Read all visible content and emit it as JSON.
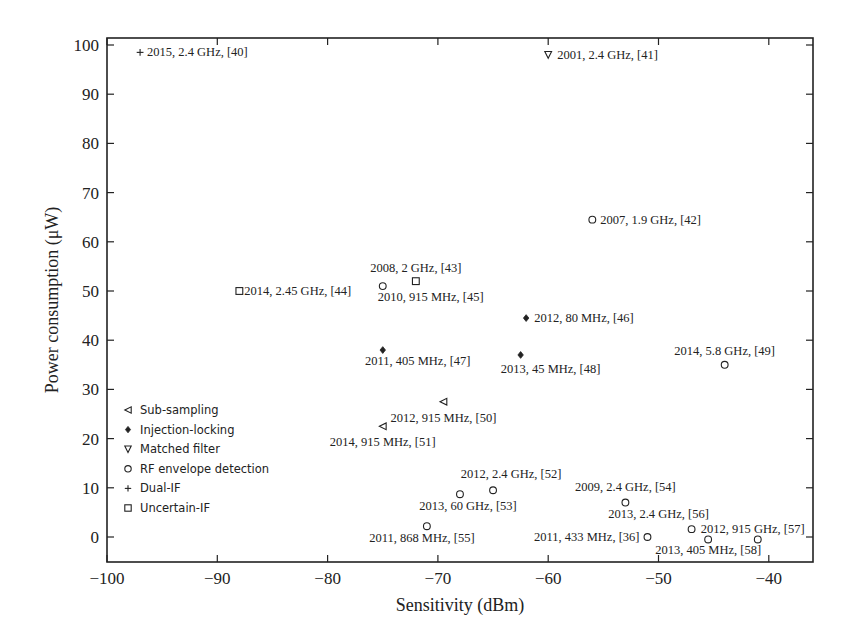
{
  "chart_data": {
    "type": "scatter",
    "title": "",
    "xlabel": "Sensitivity (dBm)",
    "ylabel": "Power consumption (μW)",
    "xlim": [
      -100,
      -36
    ],
    "ylim": [
      -5,
      102
    ],
    "xticks": [
      -100,
      -90,
      -80,
      -70,
      -60,
      -50,
      -40
    ],
    "xtick_labels": [
      "−100",
      "−90",
      "−80",
      "−70",
      "−60",
      "−50",
      "−40"
    ],
    "yticks": [
      0,
      10,
      20,
      30,
      40,
      50,
      60,
      70,
      80,
      90,
      100
    ],
    "grid": false,
    "legend_position": "lower left inside",
    "legend": [
      {
        "name": "Sub-sampling",
        "marker": "triangle-left"
      },
      {
        "name": "Injection-locking",
        "marker": "diamond-filled"
      },
      {
        "name": "Matched filter",
        "marker": "triangle-down"
      },
      {
        "name": "RF envelope detection",
        "marker": "circle"
      },
      {
        "name": "Dual-IF",
        "marker": "plus"
      },
      {
        "name": "Uncertain-IF",
        "marker": "square"
      }
    ],
    "series": [
      {
        "name": "Sub-sampling",
        "marker": "triangle-left",
        "points": [
          {
            "x": -69.5,
            "y": 27.5,
            "label": "2012, 915 MHz, [50]",
            "lx": 0,
            "ly": 20,
            "anchor": "middle"
          },
          {
            "x": -75,
            "y": 22.5,
            "label": "2014, 915 MHz, [51]",
            "lx": 0,
            "ly": 20,
            "anchor": "middle"
          }
        ]
      },
      {
        "name": "Injection-locking",
        "marker": "diamond-filled",
        "points": [
          {
            "x": -62,
            "y": 44.5,
            "label": "2012, 80 MHz, [46]",
            "lx": 8,
            "ly": 4,
            "anchor": "start"
          },
          {
            "x": -75,
            "y": 38,
            "label": "2011, 405 MHz, [47]",
            "lx": 35,
            "ly": 15,
            "anchor": "middle"
          },
          {
            "x": -62.5,
            "y": 37,
            "label": "2013, 45 MHz, [48]",
            "lx": 30,
            "ly": 18,
            "anchor": "middle"
          }
        ]
      },
      {
        "name": "Matched filter",
        "marker": "triangle-down",
        "points": [
          {
            "x": -60,
            "y": 98,
            "label": "2001, 2.4 GHz, [41]",
            "lx": 9,
            "ly": 4,
            "anchor": "start"
          }
        ]
      },
      {
        "name": "RF envelope detection",
        "marker": "circle",
        "points": [
          {
            "x": -56,
            "y": 64.5,
            "label": "2007, 1.9 GHz, [42]",
            "lx": 8,
            "ly": 4,
            "anchor": "start"
          },
          {
            "x": -75,
            "y": 51,
            "label": "2010, 915 MHz, [45]",
            "lx": 48,
            "ly": 15,
            "anchor": "middle"
          },
          {
            "x": -44,
            "y": 35,
            "label": "2014, 5.8 GHz, [49]",
            "lx": 0,
            "ly": -10,
            "anchor": "middle"
          },
          {
            "x": -65,
            "y": 9.5,
            "label": "2012, 2.4 GHz, [52]",
            "lx": 18,
            "ly": -12,
            "anchor": "middle"
          },
          {
            "x": -68,
            "y": 8.7,
            "label": "2013, 60 GHz, [53]",
            "lx": 8,
            "ly": 16,
            "anchor": "middle"
          },
          {
            "x": -53,
            "y": 7,
            "label": "2009, 2.4 GHz, [54]",
            "lx": 0,
            "ly": -12,
            "anchor": "middle"
          },
          {
            "x": -71,
            "y": 2.2,
            "label": "2011, 868 MHz, [55]",
            "lx": -5,
            "ly": 16,
            "anchor": "middle"
          },
          {
            "x": -47,
            "y": 1.6,
            "label": "2013, 2.4 GHz, [56]",
            "lx": -33,
            "ly": -11,
            "anchor": "middle"
          },
          {
            "x": -51,
            "y": 0,
            "label": "2011, 433 MHz, [36]",
            "lx": -8,
            "ly": 4,
            "anchor": "end"
          },
          {
            "x": -45.5,
            "y": -0.5,
            "label": "2013, 405 MHz, [58]",
            "lx": 0,
            "ly": 15,
            "anchor": "middle"
          },
          {
            "x": -41,
            "y": -0.5,
            "label": "2012, 915 GHz, [57]",
            "lx": -5,
            "ly": -6,
            "anchor": "middle"
          }
        ]
      },
      {
        "name": "Dual-IF",
        "marker": "plus",
        "points": [
          {
            "x": -97,
            "y": 98.5,
            "label": "2015, 2.4 GHz, [40]",
            "lx": 7,
            "ly": 4,
            "anchor": "start"
          }
        ]
      },
      {
        "name": "Uncertain-IF",
        "marker": "square",
        "points": [
          {
            "x": -88,
            "y": 50,
            "label": "2014, 2.45 GHz, [44]",
            "lx": 5,
            "ly": 4,
            "anchor": "start"
          },
          {
            "x": -72,
            "y": 52,
            "label": "2008, 2 GHz, [43]",
            "lx": 0,
            "ly": -9,
            "anchor": "middle"
          }
        ]
      }
    ]
  },
  "colors": {
    "axis": "#222222",
    "marker": "#222222",
    "background": "#ffffff"
  }
}
